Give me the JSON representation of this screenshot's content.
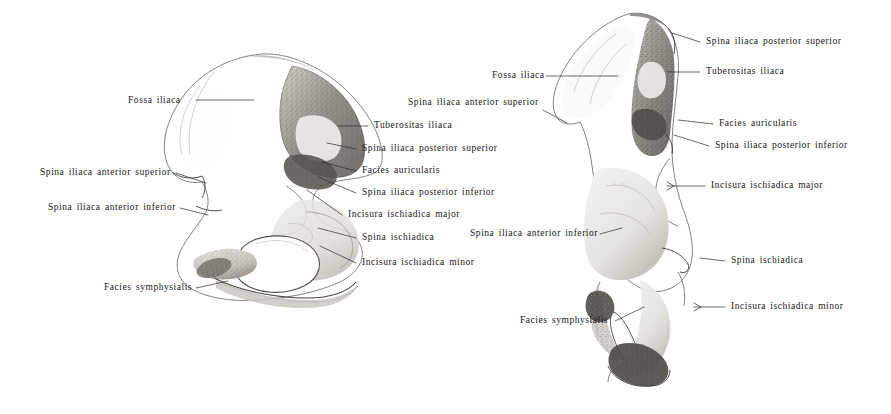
{
  "plate": {
    "title": "Os coxae — two views",
    "background_color": "#ffffff",
    "ink_color": "#17161a",
    "width": 891,
    "height": 414
  },
  "figures": [
    {
      "id": "left-figure",
      "name": "os-coxae-medial-view",
      "caption": "",
      "labels": [
        {
          "id": "l-fossa-iliaca",
          "text": "Fossa iliaca",
          "x": 128,
          "y": 104,
          "align": "left",
          "leader": "M196,100 L254,100"
        },
        {
          "id": "l-sias",
          "text": "Spina iliaca anterior superior",
          "x": 40,
          "y": 176,
          "align": "left",
          "leader": "M176,173 L206,183"
        },
        {
          "id": "l-siai",
          "text": "Spina iliaca anterior inferior",
          "x": 48,
          "y": 211,
          "align": "left",
          "leader": "M180,208 L208,215"
        },
        {
          "id": "l-facies-symph",
          "text": "Facies symphysialis",
          "x": 104,
          "y": 291,
          "align": "left",
          "leader": "M196,288 L228,281"
        },
        {
          "id": "l-sias-2",
          "text": "Spina iliaca anterior superior",
          "x": 408,
          "y": 106,
          "align": "left",
          "leader": "M543,110 L567,123"
        },
        {
          "id": "l-tuberositas",
          "text": "Tuberositas iliaca",
          "x": 374,
          "y": 129,
          "align": "left",
          "leader": "M368,126 L338,126"
        },
        {
          "id": "l-sips",
          "text": "Spina iliaca posterior superior",
          "x": 362,
          "y": 152,
          "align": "left",
          "leader": "M356,149 L327,143"
        },
        {
          "id": "l-facies-aur",
          "text": "Facies auricularis",
          "x": 362,
          "y": 174,
          "align": "left",
          "leader": "M356,171 L322,162"
        },
        {
          "id": "l-sipi",
          "text": "Spina iliaca posterior inferior",
          "x": 362,
          "y": 196,
          "align": "left",
          "leader": "M356,193 L318,177"
        },
        {
          "id": "l-inc-major",
          "text": "Incisura ischiadica major",
          "x": 348,
          "y": 218,
          "align": "left",
          "leader": "M342,215 L307,190"
        },
        {
          "id": "l-spina-isch",
          "text": "Spina ischiadica",
          "x": 362,
          "y": 241,
          "align": "left",
          "leader": "M356,238 L318,228"
        },
        {
          "id": "l-inc-minor",
          "text": "Incisura ischiadica minor",
          "x": 362,
          "y": 266,
          "align": "left",
          "leader": "M356,263 L320,246"
        }
      ]
    },
    {
      "id": "right-figure",
      "name": "os-coxae-posterior-view",
      "caption": "",
      "labels": [
        {
          "id": "r-sips",
          "text": "Spina iliaca posterior superior",
          "x": 706,
          "y": 45,
          "align": "left",
          "leader": "M700,42 L672,33"
        },
        {
          "id": "r-fossa-iliaca",
          "text": "Fossa iliaca",
          "x": 492,
          "y": 79,
          "align": "left",
          "leader": "M546,76 L618,76"
        },
        {
          "id": "r-tuberositas",
          "text": "Tuberositas iliaca",
          "x": 706,
          "y": 75,
          "align": "left",
          "leader": "M700,72 L668,72"
        },
        {
          "id": "r-facies-aur",
          "text": "Facies auricularis",
          "x": 719,
          "y": 127,
          "align": "left",
          "leader": "M713,124 L678,120"
        },
        {
          "id": "r-sipi",
          "text": "Spina iliaca posterior inferior",
          "x": 715,
          "y": 149,
          "align": "left",
          "leader": "M709,146 L674,135"
        },
        {
          "id": "r-inc-major",
          "text": "Incisura ischiadica major",
          "x": 711,
          "y": 189,
          "align": "left",
          "leader": "M705,186 L667,186"
        },
        {
          "id": "r-siai",
          "text": "Spina iliaca anterior inferior",
          "x": 470,
          "y": 237,
          "align": "left",
          "leader": "M600,234 L622,228"
        },
        {
          "id": "r-spina-isch",
          "text": "Spina ischiadica",
          "x": 731,
          "y": 264,
          "align": "left",
          "leader": "M725,261 L700,258"
        },
        {
          "id": "r-inc-minor",
          "text": "Incisura ischiadica minor",
          "x": 731,
          "y": 310,
          "align": "left",
          "leader": "M725,307 L694,307"
        },
        {
          "id": "r-facies-symph",
          "text": "Facies symphysialis",
          "x": 520,
          "y": 324,
          "align": "left",
          "leader": "M615,321 L644,307"
        }
      ]
    }
  ]
}
